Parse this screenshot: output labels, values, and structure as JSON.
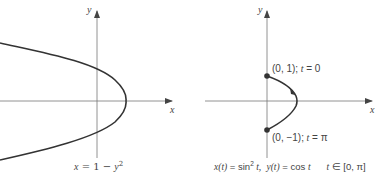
{
  "left_panel": {
    "axis_x_label": "x",
    "axis_y_label": "y",
    "caption": {
      "lhs": "x",
      "eq": " = 1 − ",
      "var": "y",
      "exp": "2"
    },
    "curve": "x = 1 - y^2",
    "stroke_color": "#333333"
  },
  "right_panel": {
    "axis_x_label": "x",
    "axis_y_label": "y",
    "point_top": {
      "coord": "(0, 1);",
      "param": " t",
      "eq": " = 0"
    },
    "point_bottom": {
      "coord": "(0, −1);",
      "param": " t",
      "eq": " = π"
    },
    "caption": {
      "x_part": "x(t)",
      "x_eq": " = sin",
      "x_exp": "2",
      "x_t": " t,",
      "y_part": "y(t)",
      "y_eq": " = cos ",
      "y_t": "t",
      "range_t": "t",
      "range": " ∈ [0, π]"
    },
    "curve": "x(t) = sin^2 t, y(t) = cos t, t in [0, pi]",
    "stroke_color": "#333333"
  }
}
